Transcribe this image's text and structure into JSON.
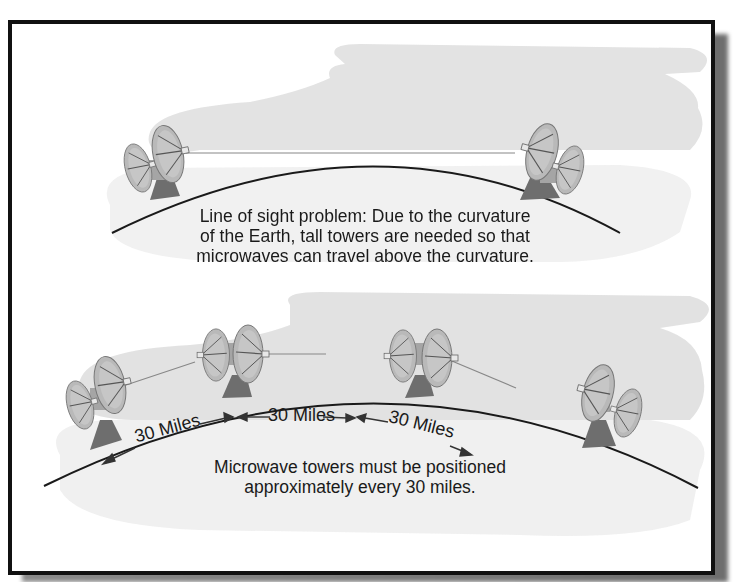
{
  "figure": {
    "top_panel": {
      "caption_lines": [
        "Line of sight problem: Due to the curvature",
        "of the Earth, tall towers are needed so that",
        "microwaves can travel above the curvature."
      ],
      "tower_count": 2
    },
    "bottom_panel": {
      "distance_labels": [
        "30 Miles",
        "30 Miles",
        "30 Miles"
      ],
      "caption_lines": [
        "Microwave towers must be positioned",
        "approximately every 30 miles."
      ],
      "tower_count": 4
    },
    "colors": {
      "frame": "#111111",
      "background": "#ffffff",
      "cloud": "#dcdcdc",
      "earth_line": "#1a1a1a",
      "dish": "#b8b8b8",
      "shadow": "#7a7a7a"
    }
  }
}
